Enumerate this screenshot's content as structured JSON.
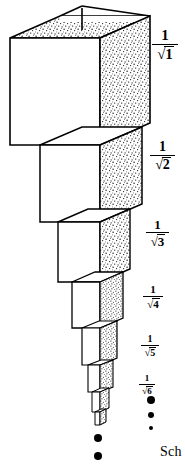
{
  "figure": {
    "caption_fragment": "Sch",
    "ink_color": "#000000",
    "background_color": "#ffffff",
    "stipple_color": "#1a1a1a",
    "labels": [
      {
        "id": "label-1",
        "numerator": "1",
        "radical": "√",
        "radicand": "1",
        "text": "1/√1",
        "x": 155,
        "y": 38,
        "size": 15
      },
      {
        "id": "label-2",
        "numerator": "1",
        "radical": "√",
        "radicand": "2",
        "text": "1/√2",
        "x": 152,
        "y": 150,
        "size": 14
      },
      {
        "id": "label-3",
        "numerator": "1",
        "radical": "√",
        "radicand": "3",
        "text": "1/√3",
        "x": 148,
        "y": 227,
        "size": 13
      },
      {
        "id": "label-4",
        "numerator": "1",
        "radical": "√",
        "radicand": "4",
        "text": "1/√4",
        "x": 145,
        "y": 292,
        "size": 11
      },
      {
        "id": "label-5",
        "numerator": "1",
        "radical": "√",
        "radicand": "5",
        "text": "1/√5",
        "x": 143,
        "y": 342,
        "size": 10
      },
      {
        "id": "label-6",
        "numerator": "1",
        "radical": "√",
        "radicand": "6",
        "text": "1/√6",
        "x": 141,
        "y": 381,
        "size": 9
      }
    ],
    "right_ellipsis": {
      "name": "vertical-ellipsis-right",
      "dots": [
        {
          "x": 151,
          "y": 400,
          "r": 4.0
        },
        {
          "x": 151,
          "y": 415,
          "r": 3.0
        },
        {
          "x": 151,
          "y": 428,
          "r": 2.2
        }
      ]
    },
    "bottom_ellipsis": {
      "name": "vertical-ellipsis-bottom",
      "dots": [
        {
          "x": 98,
          "y": 438,
          "r": 4.2
        },
        {
          "x": 98,
          "y": 456,
          "r": 4.2
        }
      ]
    },
    "boxes": [
      {
        "n": 1,
        "label": "1/√1",
        "front_left": 10,
        "front_right": 100,
        "front_top": 38,
        "front_bottom": 145,
        "depth_dx": 50,
        "depth_dy": -22
      },
      {
        "n": 2,
        "label": "1/√2",
        "front_left": 40,
        "front_right": 100,
        "front_top": 145,
        "front_bottom": 222,
        "depth_dx": 42,
        "depth_dy": -18
      },
      {
        "n": 3,
        "label": "1/√3",
        "front_left": 58,
        "front_right": 100,
        "front_top": 222,
        "front_bottom": 282,
        "depth_dx": 30,
        "depth_dy": -13
      },
      {
        "n": 4,
        "label": "1/√4",
        "front_left": 72,
        "front_right": 100,
        "front_top": 282,
        "front_bottom": 328,
        "depth_dx": 23,
        "depth_dy": -10
      },
      {
        "n": 5,
        "label": "1/√5",
        "front_left": 82,
        "front_right": 100,
        "front_top": 328,
        "front_bottom": 365,
        "depth_dx": 17,
        "depth_dy": -7
      },
      {
        "n": 6,
        "label": "1/√6",
        "front_left": 88,
        "front_right": 100,
        "front_top": 365,
        "front_bottom": 392,
        "depth_dx": 13,
        "depth_dy": -5
      },
      {
        "n": 7,
        "label": "",
        "front_left": 92,
        "front_right": 100,
        "front_top": 392,
        "front_bottom": 412,
        "depth_dx": 9,
        "depth_dy": -4
      },
      {
        "n": 8,
        "label": "",
        "front_left": 95,
        "front_right": 100,
        "front_top": 412,
        "front_bottom": 425,
        "depth_dx": 6,
        "depth_dy": -3
      }
    ]
  }
}
